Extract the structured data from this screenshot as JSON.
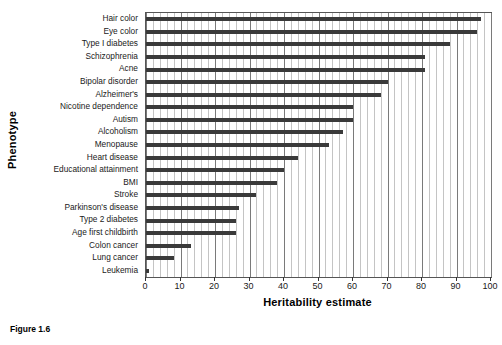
{
  "figure": {
    "caption": "Figure 1.6"
  },
  "chart_data": {
    "type": "bar",
    "orientation": "horizontal",
    "title": "",
    "xlabel": "Heritability estimate",
    "ylabel": "Phenotype",
    "xlim": [
      0,
      100
    ],
    "ylim": null,
    "grid": "vertical-major-and-minor",
    "legend": null,
    "bar_color": "#3a3a3a",
    "axis_color": "#555555",
    "major_tick_step": 10,
    "minor_tick_step": 2,
    "xticks": [
      0,
      10,
      20,
      30,
      40,
      50,
      60,
      70,
      80,
      90,
      100
    ],
    "xticklabels": [
      "0",
      "10",
      "20",
      "30",
      "40",
      "50",
      "60",
      "70",
      "80",
      "90",
      "100"
    ],
    "categories": [
      "Hair color",
      "Eye color",
      "Type I diabetes",
      "Schizophrenia",
      "Acne",
      "Bipolar disorder",
      "Alzheimer's",
      "Nicotine dependence",
      "Autism",
      "Alcoholism",
      "Menopause",
      "Heart disease",
      "Educational attainment",
      "BMI",
      "Stroke",
      "Parkinson's disease",
      "Type 2 diabetes",
      "Age first childbirth",
      "Colon cancer",
      "Lung cancer",
      "Leukemia"
    ],
    "values": [
      97,
      96,
      88,
      81,
      81,
      70,
      68,
      60,
      60,
      57,
      53,
      44,
      40,
      38,
      32,
      27,
      26,
      26,
      13,
      8,
      1
    ]
  }
}
